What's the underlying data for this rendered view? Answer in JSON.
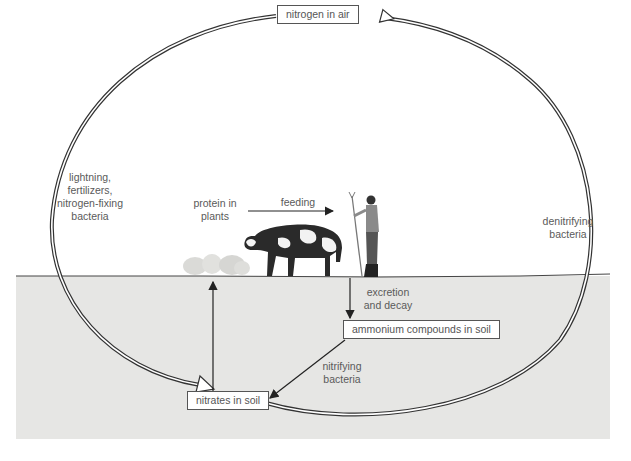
{
  "diagram": {
    "boxes": {
      "air": "nitrogen in air",
      "ammonium": "ammonium compounds in soil",
      "nitrates": "nitrates in soil"
    },
    "labels": {
      "fixation": "lightning,\nfertilizers,\nnitrogen-fixing\nbacteria",
      "denitrifying": "denitrifying\nbacteria",
      "protein": "protein in\nplants",
      "feeding": "feeding",
      "excretion": "excretion\nand decay",
      "nitrifying": "nitrifying\nbacteria"
    },
    "illustrations": [
      "plants",
      "cow",
      "farmer-with-pitchfork"
    ],
    "colors": {
      "soil": "#e6e6e4",
      "line": "#333333",
      "text": "#5a5a5a"
    }
  }
}
